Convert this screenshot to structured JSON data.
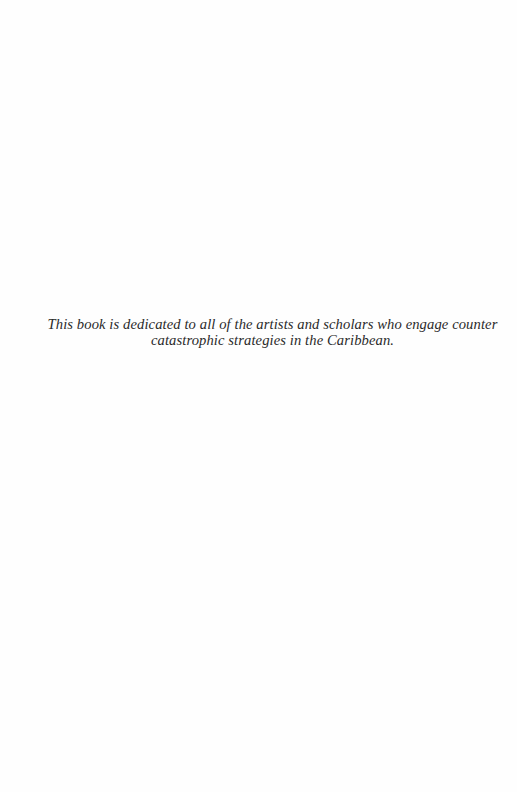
{
  "page": {
    "type": "dedication",
    "background_color": "#fefefe",
    "text_color": "#2a2a2a"
  },
  "dedication": {
    "lines": [
      "This book is dedicated to all of the artists and scholars who engage counter",
      "catastrophic strategies in the Caribbean."
    ]
  }
}
